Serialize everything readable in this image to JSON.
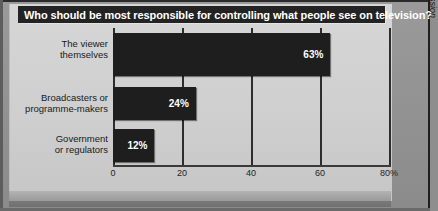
{
  "chart_data": {
    "type": "bar",
    "orientation": "horizontal",
    "title": "Who should be most responsible for controlling what people see on television?",
    "categories": [
      "The viewer themselves",
      "Broadcasters or programme-makers",
      "Government or regulators"
    ],
    "category_lines": [
      [
        "The viewer",
        "themselves"
      ],
      [
        "Broadcasters or",
        "programme-makers"
      ],
      [
        "Government",
        "or regulators"
      ]
    ],
    "values": [
      63,
      24,
      12
    ],
    "value_labels": [
      "63%",
      "24%",
      "12%"
    ],
    "xlabel": "",
    "ylabel": "",
    "xlim": [
      0,
      80
    ],
    "xticks": [
      0,
      20,
      40,
      60,
      80
    ],
    "xtick_labels": [
      "0",
      "20",
      "40",
      "60",
      "80%"
    ],
    "grid": true,
    "legend": false,
    "source": "Source: Broadcasting Standards Commission"
  },
  "colors": {
    "bar": "#1e1e1e",
    "title_background": "#232323",
    "title_text": "#ffffff",
    "panel": "#d6d6d6",
    "frame": "#8e8e8e",
    "gridline": "#2d2d2d"
  }
}
